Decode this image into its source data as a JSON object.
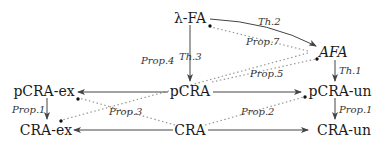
{
  "nodes": {
    "lambda_fa": "λ-FA",
    "afa": "AFA",
    "pcra_ex": "pCRA-ex",
    "pcra": "pCRA",
    "pcra_un": "pCRA-un",
    "cra_ex": "CRA-ex",
    "cra": "CRA",
    "cra_un": "CRA-un"
  },
  "edges": {
    "th2": "Th.2",
    "th3": "Th.3",
    "th1": "Th.1",
    "prop7": "Prop.7",
    "prop4": "Prop.4",
    "prop5": "Prop.5",
    "prop1_left": "Prop.1",
    "prop1_right": "Prop.1",
    "prop3": "Prop.3",
    "prop2": "Prop.2"
  },
  "relations": [
    {
      "from": "λ-FA",
      "to": "AFA",
      "label": "Th.2",
      "style": "solid"
    },
    {
      "from": "λ-FA",
      "to": "pCRA",
      "label": "Th.3",
      "style": "solid"
    },
    {
      "from": "AFA",
      "to": "pCRA-un",
      "label": "Th.1",
      "style": "solid"
    },
    {
      "from": "pCRA",
      "to": "pCRA-ex",
      "label": "",
      "style": "solid"
    },
    {
      "from": "pCRA",
      "to": "pCRA-un",
      "label": "",
      "style": "solid"
    },
    {
      "from": "pCRA-ex",
      "to": "CRA-ex",
      "label": "Prop.1",
      "style": "solid"
    },
    {
      "from": "pCRA-un",
      "to": "CRA-un",
      "label": "Prop.1",
      "style": "solid"
    },
    {
      "from": "CRA",
      "to": "CRA-ex",
      "label": "",
      "style": "solid"
    },
    {
      "from": "CRA",
      "to": "CRA-un",
      "label": "",
      "style": "solid"
    },
    {
      "from": "AFA",
      "to": "λ-FA",
      "label": "Prop.7",
      "style": "dotted"
    },
    {
      "from": "AFA",
      "to": "CRA-ex",
      "label": "Prop.4",
      "style": "dotted"
    },
    {
      "from": "pCRA",
      "to": "AFA",
      "label": "Prop.5",
      "style": "dotted"
    },
    {
      "from": "CRA",
      "to": "pCRA-ex",
      "label": "Prop.3",
      "style": "dotted"
    },
    {
      "from": "CRA",
      "to": "pCRA-un",
      "label": "Prop.2",
      "style": "dotted"
    }
  ]
}
